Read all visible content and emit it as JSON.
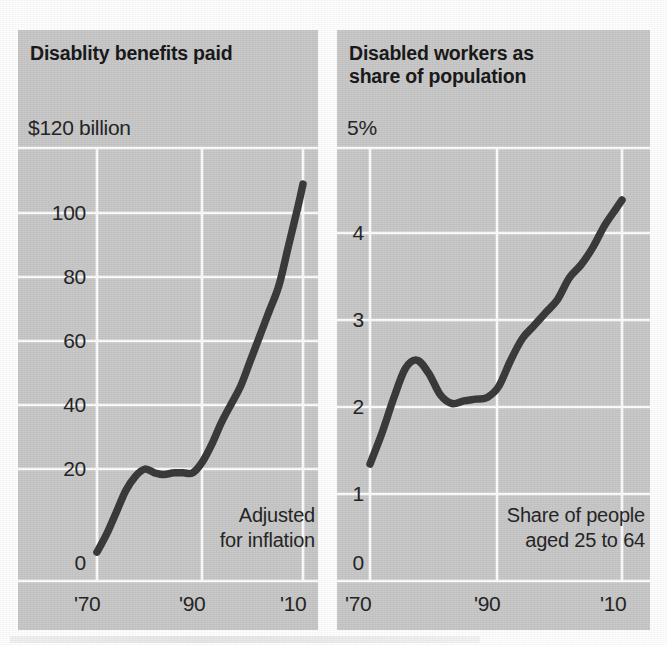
{
  "colors": {
    "panel_fill": "#c9c9c9",
    "gridline": "#fdfdfd",
    "line": "#3b3b3b",
    "text": "#262626",
    "background": "#ffffff"
  },
  "panels": [
    {
      "id": "left",
      "title": "Disablity benefits paid",
      "axis_top_label": "$120 billion",
      "yticks": [
        "100",
        "80",
        "60",
        "40",
        "20",
        "0"
      ],
      "xticks": [
        "'70",
        "'90",
        "'10"
      ],
      "note": "Adjusted\nfor inflation"
    },
    {
      "id": "right",
      "title": "Disabled workers as\nshare of population",
      "axis_top_label": "5%",
      "yticks": [
        "4",
        "3",
        "2",
        "1",
        "0"
      ],
      "xticks": [
        "'70",
        "'90",
        "'10"
      ],
      "note": "Share of people\naged 25 to 64"
    }
  ],
  "chart_data": [
    {
      "type": "line",
      "title": "Disablity benefits paid",
      "subtitle": "Adjusted for inflation",
      "xlabel": "",
      "ylabel": "$120 billion",
      "ytick_labels": [
        "$120 billion",
        "100",
        "80",
        "60",
        "40",
        "20",
        "0"
      ],
      "ytick_values": [
        120,
        100,
        80,
        60,
        40,
        20,
        0
      ],
      "xtick_labels": [
        "'70",
        "'90",
        "'10"
      ],
      "xtick_values": [
        1970,
        1990,
        2010
      ],
      "xlim": [
        1970,
        2013
      ],
      "ylim": [
        0,
        120
      ],
      "grid": true,
      "legend": "none",
      "series": [
        {
          "name": "Disability benefits paid (billions, inflation-adjusted)",
          "x": [
            1970,
            1972,
            1974,
            1976,
            1978,
            1980,
            1982,
            1984,
            1986,
            1988,
            1990,
            1992,
            1994,
            1996,
            1998,
            2000,
            2002,
            2004,
            2006,
            2008,
            2010,
            2012,
            2013
          ],
          "values": [
            8,
            13,
            19,
            25,
            29,
            31,
            30,
            29.5,
            30,
            30,
            30,
            33,
            38,
            44,
            49,
            54,
            61,
            68,
            75,
            82,
            93,
            104,
            110
          ]
        }
      ]
    },
    {
      "type": "line",
      "title": "Disabled workers as share of population",
      "subtitle": "Share of people aged 25 to 64",
      "xlabel": "",
      "ylabel": "5%",
      "ytick_labels": [
        "5%",
        "4",
        "3",
        "2",
        "1",
        "0"
      ],
      "ytick_values": [
        5,
        4,
        3,
        2,
        1,
        0
      ],
      "xtick_labels": [
        "'70",
        "'90",
        "'10"
      ],
      "xtick_values": [
        1970,
        1990,
        2010
      ],
      "xlim": [
        1970,
        2013
      ],
      "ylim": [
        0,
        5
      ],
      "grid": true,
      "legend": "none",
      "series": [
        {
          "name": "Disabled workers as share of population aged 25 to 64 (%)",
          "x": [
            1970,
            1972,
            1974,
            1976,
            1978,
            1980,
            1982,
            1984,
            1986,
            1988,
            1990,
            1992,
            1994,
            1996,
            1998,
            2000,
            2002,
            2004,
            2006,
            2008,
            2010,
            2012,
            2013
          ],
          "values": [
            1.35,
            1.7,
            2.1,
            2.45,
            2.55,
            2.4,
            2.15,
            2.05,
            2.08,
            2.1,
            2.12,
            2.25,
            2.55,
            2.8,
            2.95,
            3.1,
            3.25,
            3.5,
            3.65,
            3.85,
            4.1,
            4.3,
            4.4
          ]
        }
      ]
    }
  ]
}
